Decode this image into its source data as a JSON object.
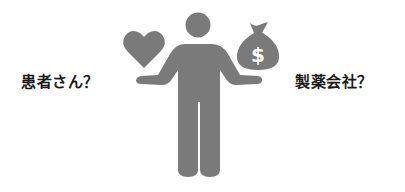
{
  "labels": {
    "left": "患者さん？",
    "right": "製薬会社？"
  },
  "icons": {
    "figure": "person-balancing-icon",
    "left_item": "heart-icon",
    "right_item": "money-bag-icon",
    "currency_symbol": "$"
  },
  "colors": {
    "icon_fill": "#7a7a7a",
    "text": "#1a1a1a",
    "background": "#ffffff"
  }
}
